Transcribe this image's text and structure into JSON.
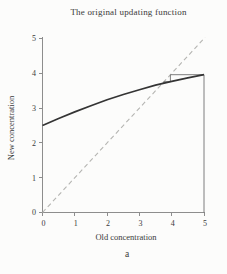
{
  "figure": {
    "panel_label": "a"
  },
  "chart_data": {
    "type": "line",
    "title": "The original updating function",
    "xlabel": "Old concentration",
    "ylabel": "New concentration",
    "xlim": [
      0,
      5
    ],
    "ylim": [
      0,
      5
    ],
    "grid": false,
    "legend": "none",
    "x_ticks": [
      "0",
      "1",
      "2",
      "3",
      "4",
      "5"
    ],
    "y_ticks": [
      "0",
      "1",
      "2",
      "3",
      "4",
      "5"
    ],
    "series": [
      {
        "name": "updating-function-curve",
        "style": "solid",
        "color": "#343434",
        "width": 1.7,
        "points": [
          [
            0,
            2.5
          ],
          [
            0.5,
            2.7
          ],
          [
            1,
            2.89
          ],
          [
            1.5,
            3.07
          ],
          [
            2,
            3.24
          ],
          [
            2.5,
            3.39
          ],
          [
            3,
            3.53
          ],
          [
            3.5,
            3.66
          ],
          [
            4,
            3.77
          ],
          [
            4.5,
            3.87
          ],
          [
            5,
            3.96
          ]
        ]
      },
      {
        "name": "identity-diagonal",
        "style": "dashed",
        "color": "#b5b5b2",
        "width": 1.1,
        "points": [
          [
            0,
            0
          ],
          [
            5.03,
            5.03
          ]
        ]
      },
      {
        "name": "cobweb-iteration",
        "style": "solid",
        "color": "#6f6f6f",
        "width": 0.9,
        "points": [
          [
            5,
            0
          ],
          [
            5,
            3.96
          ],
          [
            3.96,
            3.96
          ],
          [
            3.96,
            3.76
          ],
          [
            3.76,
            3.76
          ],
          [
            3.76,
            3.72
          ],
          [
            3.72,
            3.72
          ]
        ]
      }
    ]
  },
  "colors": {
    "text": "#3a3a3a",
    "axis": "#8d8d8d",
    "background": "#fcfcfb"
  }
}
